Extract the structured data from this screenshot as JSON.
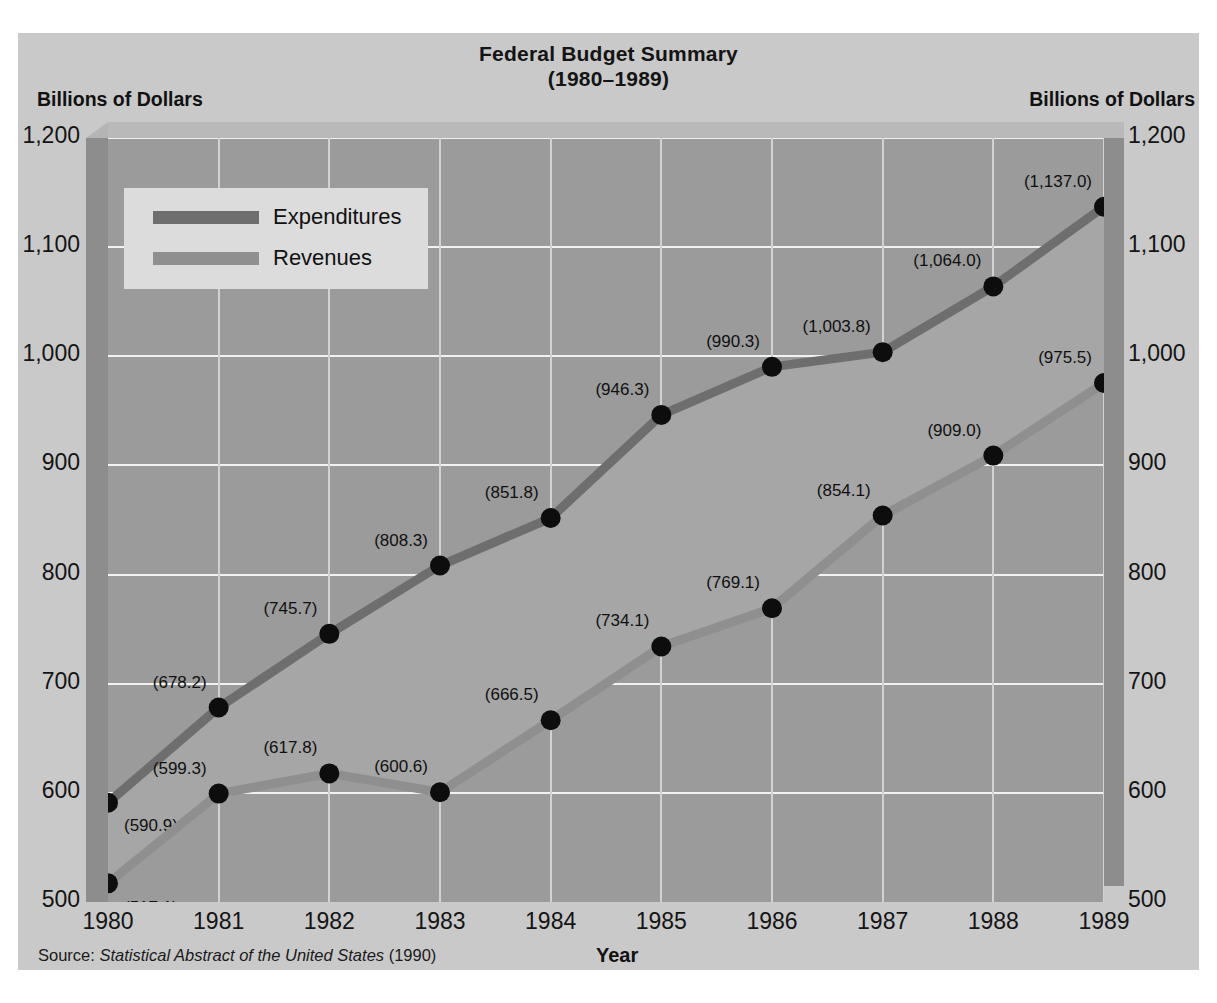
{
  "title": {
    "line1": "Federal Budget Summary",
    "line2": "(1980–1989)"
  },
  "axis_unit_left": "Billions of Dollars",
  "axis_unit_right": "Billions of Dollars",
  "xlabel": "Year",
  "source": {
    "prefix": "Source: ",
    "italic": "Statistical Abstract of the United States",
    "suffix": " (1990)"
  },
  "legend": {
    "items": [
      {
        "label": "Expenditures",
        "color": "#6e6e6e"
      },
      {
        "label": "Revenues",
        "color": "#8f8f8f"
      }
    ]
  },
  "yticks": [
    "1,200",
    "1,100",
    "1,000",
    "900",
    "800",
    "700",
    "600",
    "500"
  ],
  "colors": {
    "card": "#c9c9c9",
    "plot_background": "#9b9b9b",
    "band_fill": "#a6a6a6",
    "gridline": "#f2f2f2",
    "expenditures": "#6e6e6e",
    "revenues": "#8f8f8f",
    "marker": "#0d0d0d",
    "wall": "#8d8d8d"
  },
  "chart_data": {
    "type": "line",
    "title": "Federal Budget Summary (1980–1989)",
    "xlabel": "Year",
    "ylabel": "Billions of Dollars",
    "ylim": [
      500,
      1200
    ],
    "ytick_values": [
      500,
      600,
      700,
      800,
      900,
      1000,
      1100,
      1200
    ],
    "grid": true,
    "legend_position": "upper-left-inside",
    "categories": [
      "1980",
      "1981",
      "1982",
      "1983",
      "1984",
      "1985",
      "1986",
      "1987",
      "1988",
      "1989"
    ],
    "series": [
      {
        "name": "Expenditures",
        "color": "#6e6e6e",
        "values": [
          590.9,
          678.2,
          745.7,
          808.3,
          851.8,
          946.3,
          990.3,
          1003.8,
          1064.0,
          1137.0
        ],
        "labels": [
          "(590.9)",
          "(678.2)",
          "(745.7)",
          "(808.3)",
          "(851.8)",
          "(946.3)",
          "(990.3)",
          "(1,003.8)",
          "(1,064.0)",
          "(1,137.0)"
        ]
      },
      {
        "name": "Revenues",
        "color": "#8f8f8f",
        "values": [
          517.1,
          599.3,
          617.8,
          600.6,
          666.5,
          734.1,
          769.1,
          854.1,
          909.0,
          975.5
        ],
        "labels": [
          "(517.1)",
          "(599.3)",
          "(617.8)",
          "(600.6)",
          "(666.5)",
          "(734.1)",
          "(769.1)",
          "(854.1)",
          "(909.0)",
          "(975.5)"
        ]
      }
    ]
  }
}
